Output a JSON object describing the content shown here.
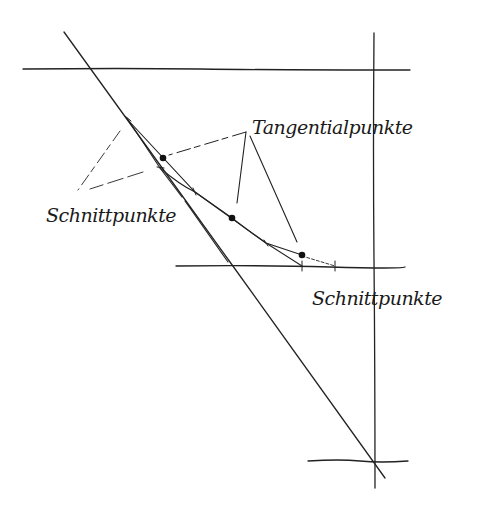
{
  "diagram": {
    "type": "hand-drawn geometric construction sketch",
    "ink_color": "#222222",
    "background": "#ffffff",
    "labels": {
      "tangent_points": "Tangentialpunkte",
      "intersection_points_left": "Schnittpunkte",
      "intersection_points_right": "Schnittpunkte"
    },
    "lines": [
      {
        "id": "top-horizontal",
        "x1": 23,
        "y1": 69,
        "x2": 410,
        "y2": 70
      },
      {
        "id": "right-vertical",
        "x1": 374,
        "y1": 33,
        "x2": 375,
        "y2": 488
      },
      {
        "id": "middle-horizontal",
        "x1": 176,
        "y1": 266,
        "x2": 405,
        "y2": 267
      },
      {
        "id": "bottom-horizontal",
        "x1": 308,
        "y1": 461,
        "x2": 408,
        "y2": 461
      },
      {
        "id": "long-diagonal",
        "x1": 64,
        "y1": 32,
        "x2": 385,
        "y2": 478
      },
      {
        "id": "inner-diagonal",
        "x1": 127,
        "y1": 118,
        "x2": 228,
        "y2": 262
      }
    ],
    "tangent_polygon": [
      [
        128,
        120
      ],
      [
        195,
        192
      ],
      [
        266,
        243
      ],
      [
        302,
        266
      ],
      [
        335,
        266
      ]
    ],
    "curve_inner": [
      [
        160,
        168
      ],
      [
        195,
        192
      ],
      [
        232,
        218
      ],
      [
        266,
        243
      ],
      [
        302,
        255
      ],
      [
        335,
        266
      ]
    ],
    "tangent_points": [
      [
        163,
        158
      ],
      [
        232,
        218
      ],
      [
        302,
        255
      ]
    ],
    "leader_lines": [
      {
        "from": [
          246,
          132
        ],
        "to": [
          169,
          155
        ],
        "dashed": true
      },
      {
        "from": [
          246,
          132
        ],
        "to": [
          237,
          203
        ],
        "dashed": false
      },
      {
        "from": [
          246,
          132
        ],
        "to": [
          297,
          242
        ],
        "dashed": false
      },
      {
        "from": [
          120,
          131
        ],
        "to": [
          78,
          190
        ],
        "dashed": true
      },
      {
        "from": [
          143,
          172
        ],
        "to": [
          90,
          189
        ],
        "dashed": true
      }
    ]
  }
}
